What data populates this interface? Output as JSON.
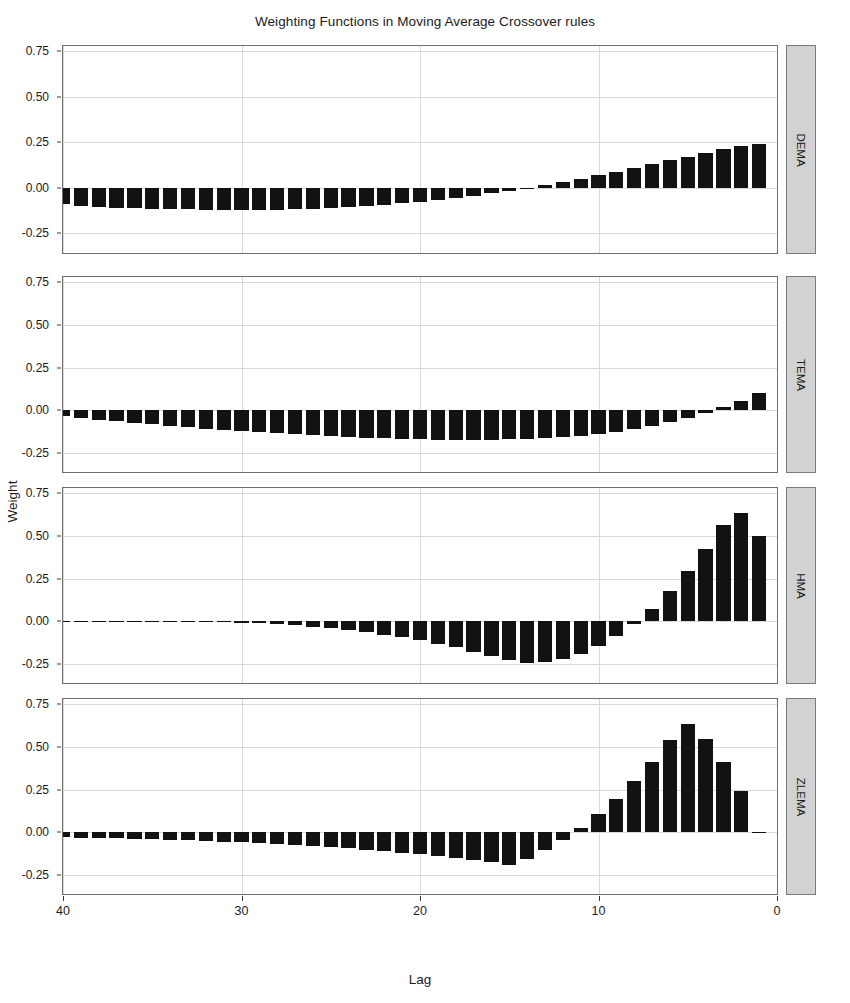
{
  "chart_data": {
    "type": "bar",
    "title": "Weighting Functions in Moving Average Crossover rules",
    "xlabel": "Lag",
    "ylabel": "Weight",
    "grid": true,
    "legend": "none",
    "x_reversed": true,
    "xlim": [
      40,
      0
    ],
    "ylim": [
      -0.36,
      0.78
    ],
    "xticks": [
      40,
      30,
      20,
      10,
      0
    ],
    "xtick_labels": [
      "40",
      "30",
      "20",
      "10",
      "0"
    ],
    "yticks": [
      0.75,
      0.5,
      0.25,
      0.0,
      -0.25
    ],
    "ytick_labels": [
      "0.75",
      "0.50",
      "0.25",
      "0.00",
      "-0.25"
    ],
    "x": [
      40,
      39,
      38,
      37,
      36,
      35,
      34,
      33,
      32,
      31,
      30,
      29,
      28,
      27,
      26,
      25,
      24,
      23,
      22,
      21,
      20,
      19,
      18,
      17,
      16,
      15,
      14,
      13,
      12,
      11,
      10,
      9,
      8,
      7,
      6,
      5,
      4,
      3,
      2,
      1
    ],
    "panels": [
      {
        "name": "DEMA",
        "values": [
          -0.092,
          -0.101,
          -0.105,
          -0.11,
          -0.113,
          -0.116,
          -0.118,
          -0.12,
          -0.121,
          -0.122,
          -0.123,
          -0.122,
          -0.121,
          -0.119,
          -0.116,
          -0.112,
          -0.107,
          -0.101,
          -0.094,
          -0.086,
          -0.077,
          -0.067,
          -0.056,
          -0.044,
          -0.031,
          -0.017,
          -0.002,
          0.014,
          0.031,
          0.049,
          0.068,
          0.088,
          0.108,
          0.129,
          0.15,
          0.171,
          0.192,
          0.211,
          0.228,
          0.243
        ]
      },
      {
        "name": "TEMA",
        "values": [
          -0.034,
          -0.044,
          -0.054,
          -0.063,
          -0.072,
          -0.081,
          -0.09,
          -0.098,
          -0.106,
          -0.114,
          -0.121,
          -0.128,
          -0.134,
          -0.14,
          -0.146,
          -0.151,
          -0.156,
          -0.16,
          -0.164,
          -0.167,
          -0.169,
          -0.171,
          -0.172,
          -0.172,
          -0.171,
          -0.169,
          -0.166,
          -0.161,
          -0.155,
          -0.147,
          -0.137,
          -0.124,
          -0.109,
          -0.091,
          -0.07,
          -0.045,
          -0.016,
          0.018,
          0.057,
          0.101
        ]
      },
      {
        "name": "HMA",
        "values": [
          0.0,
          0.0,
          0.0,
          0.0,
          0.0,
          0.0,
          0.0,
          -0.001,
          -0.002,
          -0.004,
          -0.007,
          -0.011,
          -0.016,
          -0.022,
          -0.03,
          -0.039,
          -0.05,
          -0.063,
          -0.077,
          -0.093,
          -0.111,
          -0.131,
          -0.152,
          -0.176,
          -0.201,
          -0.228,
          -0.245,
          -0.24,
          -0.222,
          -0.19,
          -0.145,
          -0.086,
          -0.013,
          0.074,
          0.176,
          0.292,
          0.422,
          0.566,
          0.635,
          0.5
        ]
      },
      {
        "name": "ZLEMA",
        "values": [
          -0.028,
          -0.03,
          -0.032,
          -0.035,
          -0.038,
          -0.041,
          -0.044,
          -0.047,
          -0.051,
          -0.055,
          -0.059,
          -0.064,
          -0.069,
          -0.075,
          -0.081,
          -0.087,
          -0.094,
          -0.102,
          -0.11,
          -0.119,
          -0.128,
          -0.138,
          -0.149,
          -0.161,
          -0.174,
          -0.188,
          -0.156,
          -0.104,
          -0.044,
          0.026,
          0.105,
          0.196,
          0.298,
          0.412,
          0.539,
          0.634,
          0.548,
          0.412,
          0.24,
          0.0
        ]
      }
    ]
  },
  "panel_labels": [
    "DEMA",
    "TEMA",
    "HMA",
    "ZLEMA"
  ],
  "colors": {
    "bar": "#121212",
    "strip_background": "#d2d2d2",
    "panel_border": "#6f6f6f",
    "gridline": "#d9d9d9",
    "text": "#1b1b1b",
    "page_background": "#ffffff"
  }
}
